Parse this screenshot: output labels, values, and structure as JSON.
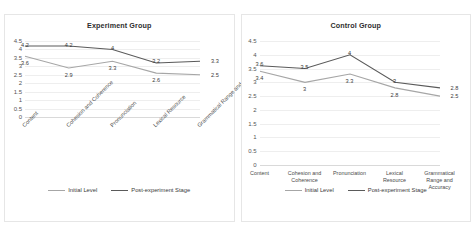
{
  "colors": {
    "initial": "#a6a6a6",
    "post": "#5a5a5a",
    "grid": "#eeeeee",
    "panel_border": "#e6e6e6",
    "text": "#3b3b3b",
    "background": "#ffffff"
  },
  "legend": {
    "initial_label": "Initial Level",
    "post_label": "Post-experiment Stage"
  },
  "chart_data": [
    {
      "type": "line",
      "title": "Experiment Group",
      "xlabel": "",
      "ylabel": "",
      "ylim": [
        0,
        4.5
      ],
      "yticks": [
        4.5,
        4,
        3.5,
        3,
        2.5,
        2,
        1.5,
        1,
        0.5,
        0
      ],
      "ytick_labels": [
        "4.5",
        "4",
        "3.5",
        "3",
        "2.5",
        "2",
        "1.5",
        "1",
        "0.5",
        "0"
      ],
      "grid": true,
      "legend_position": "bottom",
      "xlabel_rotation": -45,
      "categories": [
        "Content",
        "Cohesion and Coherence",
        "Pronunciation",
        "Lexical Resource",
        "Grammatical Range and Accuracy"
      ],
      "series": [
        {
          "name": "Initial Level",
          "color": "#a6a6a6",
          "values": [
            3.6,
            2.9,
            3.3,
            2.6,
            2.5
          ],
          "labels": [
            "3.6",
            "2.9",
            "3.3",
            "2.6",
            "2.5"
          ]
        },
        {
          "name": "Post-experiment Stage",
          "color": "#5a5a5a",
          "values": [
            4.2,
            4.2,
            4,
            3.2,
            3.3
          ],
          "labels": [
            "4.2",
            "4.2",
            "4",
            "3.2",
            "3.3"
          ]
        }
      ]
    },
    {
      "type": "line",
      "title": "Control Group",
      "xlabel": "",
      "ylabel": "",
      "ylim": [
        0,
        4.5
      ],
      "yticks": [
        4.5,
        4,
        3.5,
        3,
        2.5,
        2,
        1.5,
        1,
        0.5,
        0
      ],
      "ytick_labels": [
        "4.5",
        "4",
        "3.5",
        "3",
        "2.5",
        "2",
        "1.5",
        "1",
        "0.5",
        "0"
      ],
      "grid": true,
      "legend_position": "bottom",
      "xlabel_rotation": 0,
      "categories": [
        "Content",
        "Cohesion and Coherence",
        "Pronunciation",
        "Lexical Resource",
        "Grammatical Range and Accuracy"
      ],
      "series": [
        {
          "name": "Initial Level",
          "color": "#a6a6a6",
          "values": [
            3.4,
            3,
            3.3,
            2.8,
            2.5
          ],
          "labels": [
            "3.4",
            "3",
            "3.3",
            "2.8",
            "2.5"
          ]
        },
        {
          "name": "Post-experiment Stage",
          "color": "#5a5a5a",
          "values": [
            3.6,
            3.5,
            4,
            3,
            2.8
          ],
          "labels": [
            "3.6",
            "3.5",
            "4",
            "3",
            "2.8"
          ]
        }
      ]
    }
  ]
}
